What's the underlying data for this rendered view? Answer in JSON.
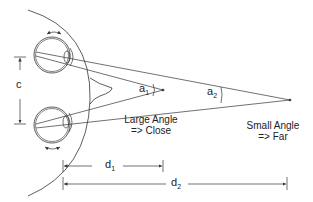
{
  "diagram": {
    "type": "binocular-vergence-depth-cue",
    "colors": {
      "line": "#333333",
      "background": "#ffffff"
    },
    "labels": {
      "c": "c",
      "a1_base": "a",
      "a1_sub": "1",
      "a2_base": "a",
      "a2_sub": "2",
      "near_line1": "Large Angle",
      "near_line2": "=> Close",
      "far_line1": "Small Angle",
      "far_line2": "=> Far",
      "d1_base": "d",
      "d1_sub": "1",
      "d2_base": "d",
      "d2_sub": "2"
    },
    "elements": {
      "head_outline": "head-arc",
      "nose": "nose-shape",
      "eyes": [
        "top-eye",
        "bottom-eye"
      ],
      "eye_rotation_arrows": [
        "top-rotation-arrow",
        "bottom-rotation-arrow"
      ],
      "sight_lines": [
        "near-convergence",
        "far-convergence"
      ],
      "dimensions": [
        "c-interocular",
        "d1-near-distance",
        "d2-far-distance"
      ]
    }
  }
}
